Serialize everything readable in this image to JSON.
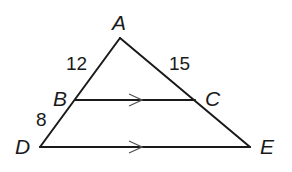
{
  "diagram": {
    "type": "triangle-proportionality",
    "vertices": {
      "A": {
        "label": "A",
        "x": 120,
        "y": 38
      },
      "B": {
        "label": "B",
        "x": 75,
        "y": 100
      },
      "C": {
        "label": "C",
        "x": 195,
        "y": 100
      },
      "D": {
        "label": "D",
        "x": 40,
        "y": 147
      },
      "E": {
        "label": "E",
        "x": 250,
        "y": 147
      }
    },
    "segment_labels": {
      "AB": "12",
      "AC": "15",
      "BD": "8"
    },
    "parallel_segments": [
      "BC",
      "DE"
    ],
    "colors": {
      "line": "#1a1a1a",
      "arrow": "#555555",
      "background": "#ffffff"
    }
  }
}
